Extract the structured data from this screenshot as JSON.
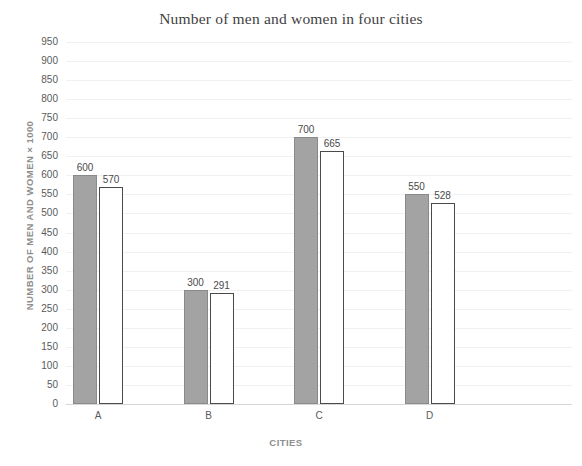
{
  "chart_data": {
    "type": "bar",
    "title": "Number of men and women in four cities",
    "xlabel": "CITIES",
    "ylabel": "NUMBER OF MEN AND WOMEN × 1000",
    "categories": [
      "A",
      "B",
      "C",
      "D"
    ],
    "series": [
      {
        "name": "men",
        "values": [
          600,
          300,
          700,
          550
        ],
        "color": "#a3a3a3",
        "style": "filled-gray"
      },
      {
        "name": "women",
        "values": [
          570,
          291,
          665,
          528
        ],
        "color": "#ffffff",
        "style": "white-outlined"
      }
    ],
    "ylim": [
      0,
      950
    ],
    "ytick_step": 50,
    "yticks": [
      0,
      50,
      100,
      150,
      200,
      250,
      300,
      350,
      400,
      450,
      500,
      550,
      600,
      650,
      700,
      750,
      800,
      850,
      900,
      950
    ],
    "ytick_labels": [
      "0",
      "50",
      "100",
      "150",
      "200",
      "250",
      "300",
      "350",
      "400",
      "450",
      "500",
      "550",
      "600",
      "650",
      "700",
      "750",
      "800",
      "850",
      "900",
      "950"
    ],
    "grid": true,
    "grid_color": "#f0f0f0",
    "legend": false,
    "data_labels": true,
    "data_labels_text": {
      "A": [
        "600",
        "570"
      ],
      "B": [
        "300",
        "291"
      ],
      "C": [
        "700",
        "665"
      ],
      "D": [
        "550",
        "528"
      ]
    }
  }
}
